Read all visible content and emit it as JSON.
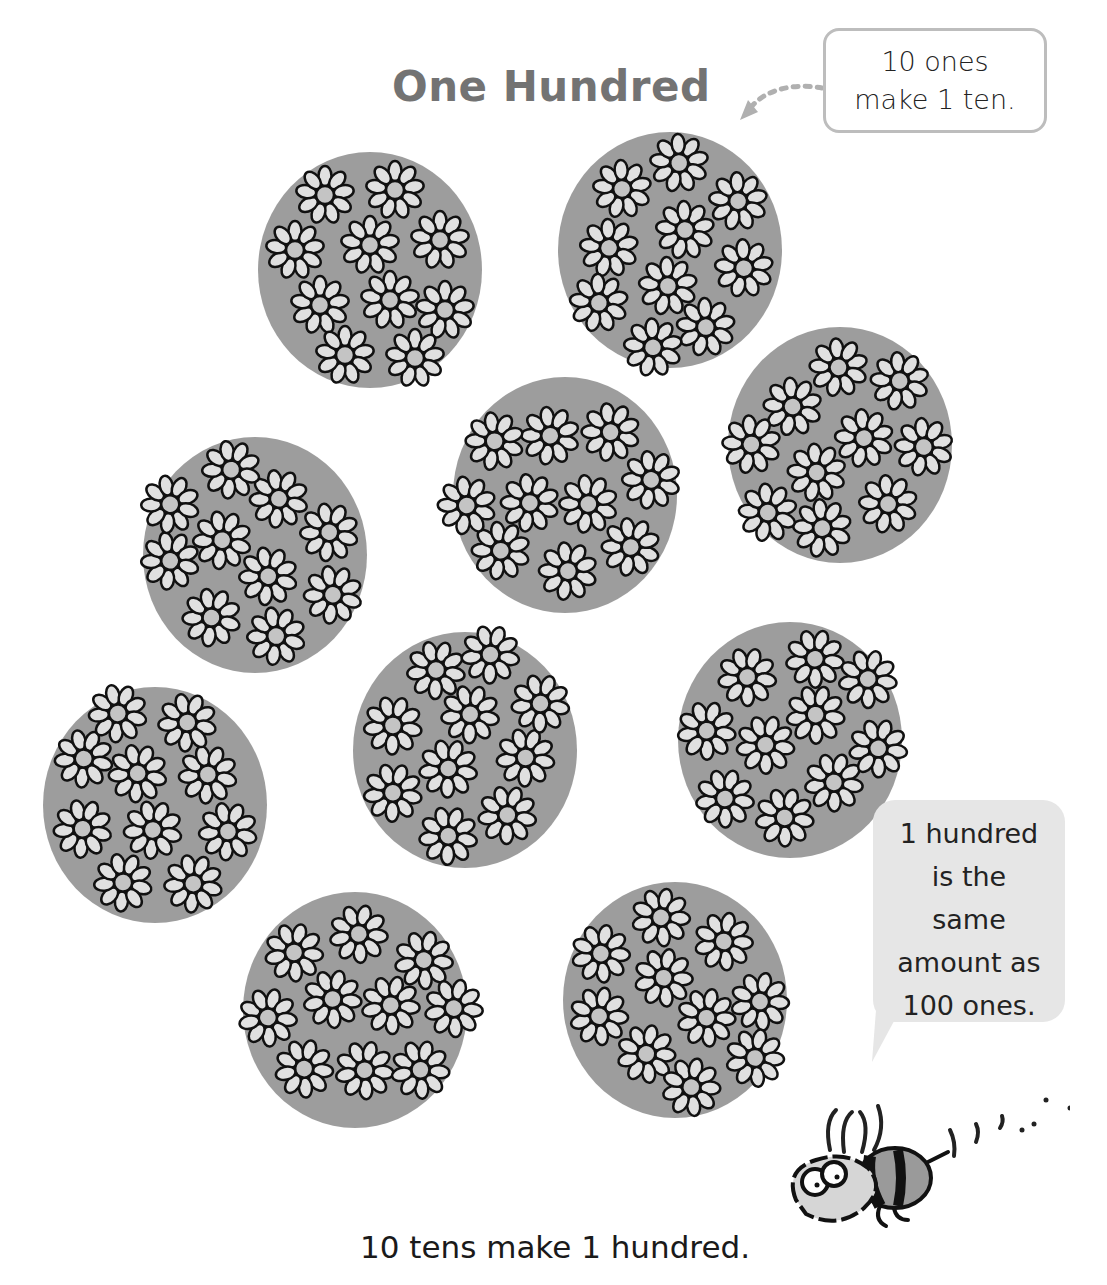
{
  "title": "One Hundred",
  "callout_top": {
    "lines": [
      "10 ones",
      "make 1 ten."
    ]
  },
  "speech_bubble": {
    "lines": [
      "1 hundred",
      "is the",
      "same",
      "amount as",
      "100 ones."
    ]
  },
  "caption": "10 tens make 1 hundred.",
  "illustration": {
    "clusters_count": 10,
    "flowers_per_cluster": 10,
    "clusters": [
      {
        "id": 1,
        "cx": 370,
        "cy": 270
      },
      {
        "id": 2,
        "cx": 670,
        "cy": 250
      },
      {
        "id": 3,
        "cx": 840,
        "cy": 445
      },
      {
        "id": 4,
        "cx": 565,
        "cy": 495
      },
      {
        "id": 5,
        "cx": 255,
        "cy": 555
      },
      {
        "id": 6,
        "cx": 155,
        "cy": 805
      },
      {
        "id": 7,
        "cx": 465,
        "cy": 750
      },
      {
        "id": 8,
        "cx": 790,
        "cy": 740
      },
      {
        "id": 9,
        "cx": 355,
        "cy": 1010
      },
      {
        "id": 10,
        "cx": 675,
        "cy": 1000
      }
    ],
    "characters": [
      "bee-icon"
    ]
  },
  "colors": {
    "title": "#737373",
    "cluster_fill": "#8c8c8c",
    "petal_fill": "#e0e0e0",
    "bubble_bg": "#e6e6e6",
    "box_border": "#bdbdbd"
  }
}
